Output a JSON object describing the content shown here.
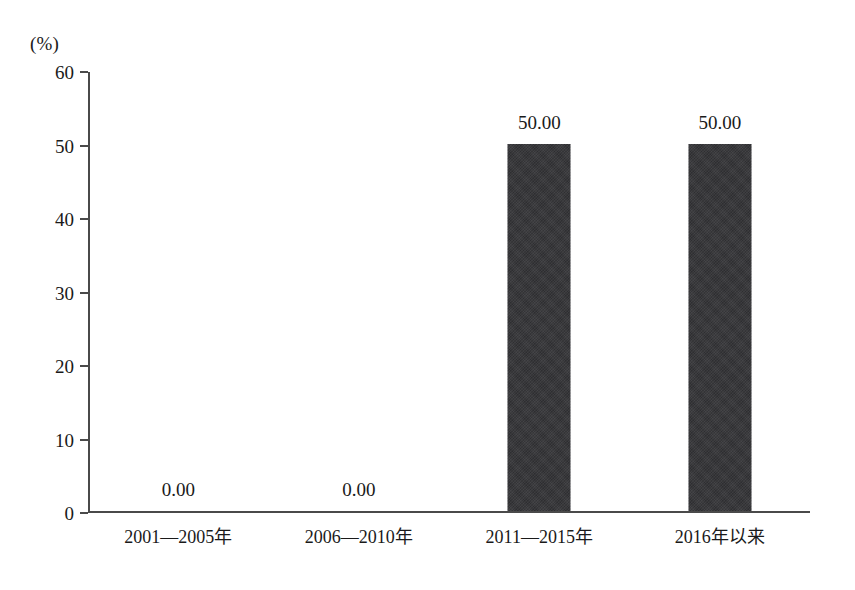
{
  "chart_data": {
    "type": "bar",
    "title": "",
    "subtitle": "",
    "xlabel": "",
    "ylabel": "",
    "unit_label": "(%)",
    "categories": [
      "2001—2005年",
      "2006—2010年",
      "2011—2015年",
      "2016年以来"
    ],
    "values": [
      0.0,
      0.0,
      50.0,
      50.0
    ],
    "data_labels": [
      "0.00",
      "0.00",
      "50.00",
      "50.00"
    ],
    "ylim": [
      0,
      60
    ],
    "ytick_step": 10,
    "ytick_labels": [
      "60",
      "50",
      "40",
      "30",
      "20",
      "10",
      "0"
    ],
    "ytick_values": [
      60,
      50,
      40,
      30,
      20,
      10,
      0
    ],
    "grid": false,
    "legend": null,
    "bar_color": "#333336",
    "axis_color": "#4a4a4a",
    "text_color": "#1a1a1a",
    "background_color": "#ffffff"
  }
}
